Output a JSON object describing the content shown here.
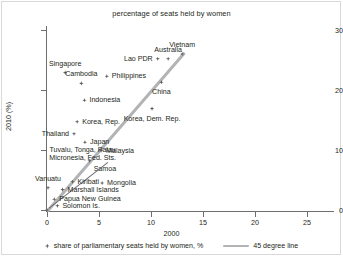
{
  "chart_data": {
    "type": "scatter",
    "title": "percentage of seats held by women",
    "xlabel": "2000",
    "ylabel": "2010 (%)",
    "xlim": [
      -1,
      27.5
    ],
    "ylim": [
      -1.5,
      31
    ],
    "xticks": [
      0,
      5,
      10,
      15,
      20,
      25
    ],
    "xticklabels": [
      "0",
      "5",
      "10",
      "15",
      "20",
      "25"
    ],
    "yticks": [
      0,
      10,
      20,
      30
    ],
    "yticklabels": [
      "0",
      "10",
      "20",
      "30"
    ],
    "grid": false,
    "legend_position": "bottom",
    "legend": [
      {
        "marker": "diamond",
        "label": "share of parliamentary seats held by women, %"
      },
      {
        "marker": "line",
        "label": "45 degree line"
      }
    ],
    "reference_line": {
      "label": "45 degree line",
      "type": "identity",
      "from": [
        0,
        0
      ],
      "to": [
        26.5,
        26.5
      ],
      "color": "#b2b3b5"
    },
    "points": [
      {
        "name": "Singapore",
        "x": 3.5,
        "y": 22.9,
        "label_pos": "above"
      },
      {
        "name": "Cambodia",
        "x": 6.6,
        "y": 21.1,
        "label_pos": "above"
      },
      {
        "name": "Philippines",
        "x": 11.5,
        "y": 22.3,
        "label_pos": "right"
      },
      {
        "name": "Indonesia",
        "x": 7.2,
        "y": 18.3,
        "label_pos": "right"
      },
      {
        "name": "Korea, Rep.",
        "x": 5.8,
        "y": 14.7,
        "label_pos": "right"
      },
      {
        "name": "Thailand",
        "x": 5.2,
        "y": 12.7,
        "label_pos": "left"
      },
      {
        "name": "Japan",
        "x": 7.3,
        "y": 11.3,
        "label_pos": "right"
      },
      {
        "name": "Malaysia",
        "x": 10.4,
        "y": 9.9,
        "label_pos": "right"
      },
      {
        "name": "Samoa",
        "x": 8.2,
        "y": 8.2,
        "label_pos": "below-right"
      },
      {
        "name": "Tuvalu, Tonga, Palau\nMicronesia, Fed. Sts.",
        "x": 0.0,
        "y": 0.0,
        "label_pos": "leader"
      },
      {
        "name": "Vanuatu",
        "x": 0.2,
        "y": 3.7,
        "label_pos": "above"
      },
      {
        "name": "Kiribati",
        "x": 4.9,
        "y": 4.7,
        "label_pos": "right"
      },
      {
        "name": "Marshall Islands",
        "x": 3.0,
        "y": 3.4,
        "label_pos": "right"
      },
      {
        "name": "Papua New Guinea",
        "x": 1.4,
        "y": 1.8,
        "label_pos": "right"
      },
      {
        "name": "Solomon Is.",
        "x": 2.0,
        "y": 0.7,
        "label_pos": "right"
      },
      {
        "name": "Mongolia",
        "x": 10.6,
        "y": 4.5,
        "label_pos": "right"
      },
      {
        "name": "Korea, Dem. Rep.",
        "x": 20.2,
        "y": 16.9,
        "label_pos": "below"
      },
      {
        "name": "China",
        "x": 22.0,
        "y": 21.3,
        "label_pos": "below"
      },
      {
        "name": "Lao PDR",
        "x": 21.3,
        "y": 25.2,
        "label_pos": "left"
      },
      {
        "name": "Australia",
        "x": 23.3,
        "y": 25.2,
        "label_pos": "above"
      },
      {
        "name": "Vietnam",
        "x": 26.0,
        "y": 26.0,
        "label_pos": "above"
      }
    ]
  }
}
